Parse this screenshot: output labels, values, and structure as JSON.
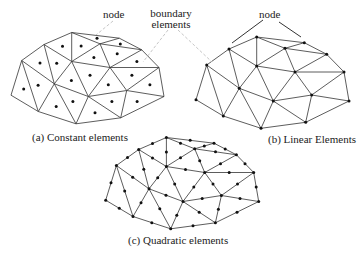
{
  "figure": {
    "labels": {
      "node_a": "node",
      "boundary_line1": "boundary",
      "boundary_line2": "elements",
      "node_b": "node",
      "caption_a": "(a) Constant elements",
      "caption_b": "(b) Linear Elements",
      "caption_c": "(c) Quadratic elements"
    },
    "colors": {
      "edge": "#333333",
      "node": "#111111",
      "callout_dashed": "#b8b8b8",
      "callout_solid": "#333333"
    },
    "mesh": {
      "nodes": {
        "A": [
          256.7,
          37
        ],
        "B": [
          229,
          49
        ],
        "C": [
          285,
          48.3
        ],
        "D": [
          304.3,
          42.7
        ],
        "E": [
          326.7,
          54.3
        ],
        "F": [
          206.7,
          65
        ],
        "G": [
          256.7,
          66
        ],
        "H": [
          295,
          72
        ],
        "I": [
          344,
          72
        ],
        "J": [
          239.3,
          88.3
        ],
        "K": [
          311.7,
          95
        ],
        "L": [
          196,
          99.7
        ],
        "M": [
          273.3,
          101
        ],
        "N": [
          349,
          101
        ],
        "O": [
          223.3,
          116
        ],
        "P": [
          261,
          128.3
        ],
        "Q": [
          305.7,
          122.3
        ]
      },
      "triangles": [
        [
          "A",
          "B",
          "G"
        ],
        [
          "A",
          "C",
          "G"
        ],
        [
          "A",
          "C",
          "D"
        ],
        [
          "C",
          "D",
          "E"
        ],
        [
          "C",
          "G",
          "H"
        ],
        [
          "C",
          "H",
          "E"
        ],
        [
          "E",
          "H",
          "I"
        ],
        [
          "B",
          "F",
          "J"
        ],
        [
          "B",
          "G",
          "J"
        ],
        [
          "F",
          "J",
          "O"
        ],
        [
          "F",
          "L",
          "O"
        ],
        [
          "J",
          "O",
          "P"
        ],
        [
          "J",
          "G",
          "M"
        ],
        [
          "J",
          "M",
          "P"
        ],
        [
          "G",
          "H",
          "M"
        ],
        [
          "H",
          "M",
          "K"
        ],
        [
          "H",
          "K",
          "I"
        ],
        [
          "I",
          "K",
          "N"
        ],
        [
          "K",
          "M",
          "Q"
        ],
        [
          "K",
          "N",
          "Q"
        ],
        [
          "M",
          "P",
          "Q"
        ]
      ]
    },
    "panels": [
      {
        "id": "a",
        "type": "constant",
        "offset": [
          -185,
          -4.5
        ]
      },
      {
        "id": "b",
        "type": "linear",
        "offset": [
          0,
          0
        ]
      },
      {
        "id": "c",
        "type": "quadratic",
        "offset": [
          -90.3,
          100.5
        ]
      }
    ]
  }
}
